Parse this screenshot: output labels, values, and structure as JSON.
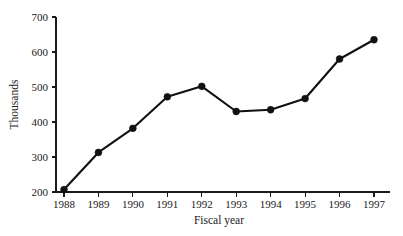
{
  "chart_data": {
    "type": "line",
    "title": "",
    "subtitle": "",
    "xlabel": "Fiscal year",
    "ylabel": "Thousands",
    "categories": [
      "1988",
      "1989",
      "1990",
      "1991",
      "1992",
      "1993",
      "1994",
      "1995",
      "1996",
      "1997"
    ],
    "values": [
      207,
      313,
      382,
      472,
      502,
      430,
      435,
      467,
      580,
      635
    ],
    "series": [
      {
        "name": "",
        "values": [
          207,
          313,
          382,
          472,
          502,
          430,
          435,
          467,
          580,
          635
        ]
      }
    ],
    "ylim": [
      200,
      700
    ],
    "yticks": [
      200,
      300,
      400,
      500,
      600,
      700
    ],
    "ytick_labels": [
      "200",
      "300",
      "400",
      "500",
      "600",
      "700"
    ],
    "xtick_labels": [
      "1988",
      "1989",
      "1990",
      "1991",
      "1992",
      "1993",
      "1994",
      "1995",
      "1996",
      "1997"
    ],
    "grid": false,
    "legend": null,
    "legend_position": "none",
    "marker": "filled-circle",
    "line_color": "#111111",
    "marker_color": "#111111",
    "axis_color": "#1a1a1a",
    "background_color": "#ffffff",
    "annotations": []
  }
}
